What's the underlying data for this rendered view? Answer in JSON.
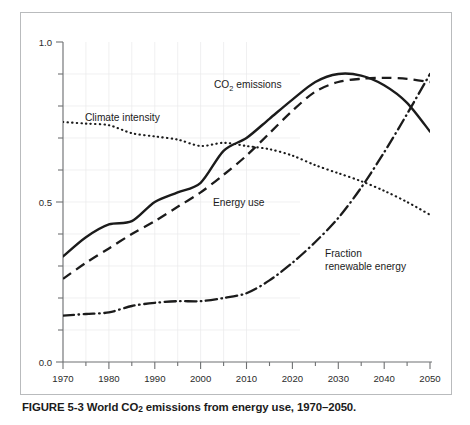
{
  "figure": {
    "caption_prefix": "FIGURE 5-3",
    "caption_text": "World CO2 emissions from energy use, 1970–2050.",
    "caption_full": "FIGURE 5-3 World CO₂ emissions from energy use, 1970–2050.",
    "caption_part_a": "FIGURE 5-3 World CO",
    "caption_sub": "2",
    "caption_part_b": " emissions from energy use, 1970–2050."
  },
  "labels": {
    "co2": "CO",
    "co2_sub": "2",
    "co2_rest": " emissions",
    "climate_intensity": "Climate intensity",
    "energy_use": "Energy use",
    "fraction_line1": "Fraction",
    "fraction_line2": "renewable energy"
  },
  "colors": {
    "ink": "#1b1b1b",
    "frame": "#b9bbbd",
    "axis": "#6f7173",
    "grid": "#e8e8ea",
    "background": "#ffffff"
  },
  "chart_data": {
    "type": "line",
    "xlabel": "",
    "ylabel": "",
    "xlim": [
      1970,
      2050
    ],
    "ylim": [
      0.0,
      1.0
    ],
    "xticks": [
      1970,
      1980,
      1990,
      2000,
      2010,
      2020,
      2030,
      2040,
      2050
    ],
    "xtick_labels": [
      "1970",
      "1980",
      "1990",
      "2000",
      "2010",
      "2020",
      "2030",
      "2040",
      "2050"
    ],
    "xminor_step": 5,
    "yticks": [
      0.0,
      0.5,
      1.0
    ],
    "ytick_labels": [
      "0.0",
      "0.5",
      "1.0"
    ],
    "yminor_step": 0.1,
    "grid": true,
    "legend": "inline-annotations",
    "x": [
      1970,
      1975,
      1980,
      1985,
      1990,
      1995,
      2000,
      2005,
      2010,
      2015,
      2020,
      2025,
      2030,
      2035,
      2040,
      2045,
      2050
    ],
    "series": [
      {
        "name": "CO2 emissions",
        "style": "solid",
        "values": [
          0.33,
          0.39,
          0.43,
          0.44,
          0.5,
          0.53,
          0.56,
          0.66,
          0.7,
          0.76,
          0.82,
          0.875,
          0.9,
          0.895,
          0.865,
          0.81,
          0.72
        ]
      },
      {
        "name": "Energy use",
        "style": "dashed",
        "values": [
          0.26,
          0.31,
          0.355,
          0.4,
          0.44,
          0.485,
          0.53,
          0.585,
          0.645,
          0.715,
          0.785,
          0.845,
          0.875,
          0.885,
          0.888,
          0.885,
          0.875
        ]
      },
      {
        "name": "Climate intensity",
        "style": "dotted",
        "values": [
          0.75,
          0.745,
          0.74,
          0.715,
          0.705,
          0.695,
          0.675,
          0.685,
          0.675,
          0.665,
          0.645,
          0.615,
          0.59,
          0.565,
          0.535,
          0.5,
          0.46
        ]
      },
      {
        "name": "Fraction renewable energy",
        "style": "dash-dot",
        "values": [
          0.145,
          0.15,
          0.155,
          0.175,
          0.185,
          0.19,
          0.19,
          0.2,
          0.215,
          0.255,
          0.31,
          0.375,
          0.45,
          0.545,
          0.655,
          0.775,
          0.9
        ]
      }
    ],
    "annotations": [
      {
        "text": "CO2 emissions",
        "x": 2010,
        "y": 0.905
      },
      {
        "text": "Climate intensity",
        "x": 1980,
        "y": 0.795
      },
      {
        "text": "Energy use",
        "x": 2013,
        "y": 0.505
      },
      {
        "text": "Fraction renewable energy",
        "x": 2033,
        "y": 0.305
      }
    ]
  }
}
